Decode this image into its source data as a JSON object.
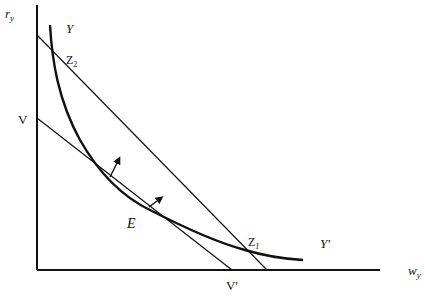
{
  "diagram": {
    "axes": {
      "y_label": "r",
      "y_label_sub": "y",
      "x_label": "w",
      "x_label_sub": "y"
    },
    "curves": {
      "isoquant_label_top": "Y",
      "isoquant_label_bottom": "Y'"
    },
    "points": {
      "v_label": "V",
      "v_prime_label": "V'",
      "e_label": "E",
      "z1_label": "Z",
      "z1_sub": "1",
      "z2_label": "Z",
      "z2_sub": "2"
    },
    "colors": {
      "line": "#111111",
      "background": "#ffffff"
    }
  }
}
